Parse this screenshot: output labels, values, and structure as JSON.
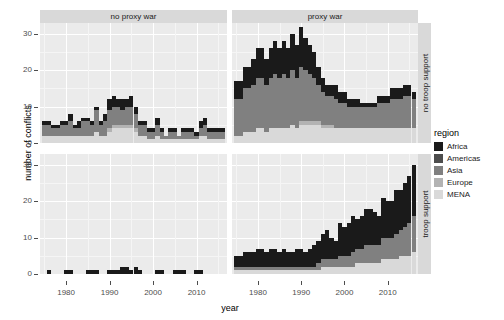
{
  "chart_data": {
    "type": "bar",
    "title": "",
    "xlabel": "year",
    "ylabel": "number of conflicts",
    "stacked": true,
    "grid": true,
    "legend_position": "right",
    "legend_title": "region",
    "xlim": [
      1974,
      2017
    ],
    "ylim": [
      0,
      33
    ],
    "xticks": [
      1980,
      1990,
      2000,
      2010
    ],
    "yticks": [
      0,
      10,
      20,
      30
    ],
    "col_facets": [
      "no proxy war",
      "proxy war"
    ],
    "row_facets": [
      "no troop support",
      "troop support"
    ],
    "series": [
      {
        "name": "Africa",
        "color": "#1a1a1a"
      },
      {
        "name": "Americas",
        "color": "#4d4d4d"
      },
      {
        "name": "Asia",
        "color": "#808080"
      },
      {
        "name": "Europe",
        "color": "#b3b3b3"
      },
      {
        "name": "MENA",
        "color": "#d9d9d9"
      }
    ],
    "years": [
      1975,
      1976,
      1977,
      1978,
      1979,
      1980,
      1981,
      1982,
      1983,
      1984,
      1985,
      1986,
      1987,
      1988,
      1989,
      1990,
      1991,
      1992,
      1993,
      1994,
      1995,
      1996,
      1997,
      1998,
      1999,
      2000,
      2001,
      2002,
      2003,
      2004,
      2005,
      2006,
      2007,
      2008,
      2009,
      2010,
      2011,
      2012,
      2013,
      2014,
      2015,
      2016
    ],
    "panels": [
      {
        "col": "no proxy war",
        "row": "no troop support",
        "values": {
          "Africa": [
            1,
            1,
            1,
            1,
            1,
            1,
            2,
            1,
            2,
            1,
            1,
            1,
            1,
            1,
            2,
            3,
            3,
            2,
            3,
            2,
            3,
            2,
            1,
            1,
            1,
            1,
            2,
            1,
            0,
            1,
            1,
            0,
            1,
            1,
            1,
            1,
            2,
            2,
            1,
            1,
            1,
            1
          ],
          "Americas": [
            0,
            0,
            0,
            0,
            0,
            0,
            0,
            0,
            0,
            0,
            0,
            0,
            0,
            0,
            0,
            0,
            0,
            0,
            0,
            0,
            0,
            0,
            0,
            0,
            0,
            0,
            0,
            0,
            0,
            0,
            0,
            0,
            0,
            0,
            0,
            0,
            0,
            0,
            0,
            0,
            0,
            0
          ],
          "Asia": [
            3,
            3,
            2,
            2,
            3,
            3,
            4,
            2,
            2,
            4,
            4,
            3,
            6,
            3,
            4,
            5,
            5,
            5,
            4,
            5,
            5,
            4,
            3,
            3,
            2,
            2,
            3,
            2,
            1,
            2,
            2,
            1,
            2,
            2,
            2,
            1,
            2,
            3,
            2,
            2,
            2,
            2
          ],
          "Europe": [
            0,
            0,
            0,
            0,
            0,
            0,
            0,
            0,
            0,
            0,
            0,
            0,
            0,
            0,
            0,
            1,
            1,
            1,
            1,
            1,
            1,
            1,
            0,
            0,
            0,
            0,
            0,
            0,
            0,
            0,
            0,
            0,
            0,
            0,
            0,
            0,
            0,
            0,
            0,
            0,
            0,
            0
          ],
          "MENA": [
            2,
            2,
            2,
            2,
            2,
            2,
            2,
            2,
            2,
            2,
            2,
            2,
            3,
            2,
            2,
            3,
            4,
            4,
            4,
            4,
            4,
            3,
            2,
            2,
            1,
            1,
            2,
            1,
            1,
            1,
            1,
            1,
            1,
            1,
            1,
            1,
            2,
            2,
            1,
            1,
            1,
            1
          ]
        }
      },
      {
        "col": "proxy war",
        "row": "no troop support",
        "values": {
          "Africa": [
            5,
            5,
            6,
            6,
            7,
            8,
            8,
            7,
            8,
            9,
            8,
            9,
            8,
            10,
            9,
            11,
            9,
            8,
            7,
            5,
            4,
            3,
            3,
            4,
            3,
            3,
            2,
            2,
            2,
            1,
            1,
            1,
            1,
            2,
            2,
            2,
            3,
            3,
            3,
            3,
            3,
            2
          ],
          "Americas": [
            0,
            0,
            0,
            0,
            0,
            0,
            0,
            0,
            0,
            0,
            0,
            0,
            0,
            0,
            0,
            0,
            0,
            0,
            0,
            0,
            0,
            0,
            0,
            0,
            0,
            0,
            0,
            0,
            0,
            0,
            0,
            0,
            0,
            0,
            0,
            0,
            0,
            0,
            0,
            0,
            0,
            0
          ],
          "Asia": [
            10,
            10,
            12,
            12,
            13,
            14,
            14,
            13,
            14,
            15,
            14,
            15,
            14,
            15,
            14,
            15,
            14,
            13,
            12,
            10,
            9,
            8,
            8,
            8,
            7,
            7,
            6,
            6,
            6,
            6,
            6,
            6,
            6,
            7,
            7,
            7,
            8,
            8,
            8,
            9,
            9,
            8
          ],
          "Europe": [
            0,
            0,
            0,
            0,
            0,
            0,
            0,
            0,
            0,
            0,
            0,
            0,
            0,
            0,
            0,
            1,
            1,
            1,
            1,
            1,
            1,
            1,
            1,
            0,
            0,
            0,
            0,
            0,
            0,
            0,
            0,
            0,
            0,
            0,
            0,
            0,
            0,
            0,
            0,
            0,
            0,
            0
          ],
          "MENA": [
            2,
            2,
            3,
            3,
            3,
            4,
            4,
            3,
            4,
            4,
            4,
            4,
            4,
            5,
            4,
            5,
            5,
            5,
            5,
            5,
            4,
            4,
            4,
            4,
            4,
            4,
            4,
            4,
            4,
            4,
            4,
            4,
            4,
            4,
            4,
            4,
            4,
            4,
            4,
            4,
            4,
            4
          ]
        }
      },
      {
        "col": "no proxy war",
        "row": "troop support",
        "values": {
          "Africa": [
            0,
            1,
            0,
            0,
            0,
            1,
            1,
            0,
            0,
            0,
            1,
            1,
            1,
            0,
            0,
            1,
            1,
            1,
            2,
            2,
            1,
            2,
            1,
            0,
            0,
            0,
            1,
            1,
            0,
            0,
            1,
            1,
            1,
            0,
            0,
            1,
            1,
            0,
            0,
            0,
            0,
            0
          ],
          "Americas": [
            0,
            0,
            0,
            0,
            0,
            0,
            0,
            0,
            0,
            0,
            0,
            0,
            0,
            0,
            0,
            0,
            0,
            0,
            0,
            0,
            0,
            0,
            0,
            0,
            0,
            0,
            0,
            0,
            0,
            0,
            0,
            0,
            0,
            0,
            0,
            0,
            0,
            0,
            0,
            0,
            0,
            0
          ],
          "Asia": [
            0,
            0,
            0,
            0,
            0,
            0,
            0,
            0,
            0,
            0,
            0,
            0,
            0,
            0,
            0,
            0,
            0,
            0,
            0,
            0,
            0,
            0,
            0,
            0,
            0,
            0,
            0,
            0,
            0,
            0,
            0,
            0,
            0,
            0,
            0,
            0,
            0,
            0,
            0,
            0,
            0,
            0
          ],
          "Europe": [
            0,
            0,
            0,
            0,
            0,
            0,
            0,
            0,
            0,
            0,
            0,
            0,
            0,
            0,
            0,
            0,
            0,
            0,
            0,
            0,
            0,
            0,
            0,
            0,
            0,
            0,
            0,
            0,
            0,
            0,
            0,
            0,
            0,
            0,
            0,
            0,
            0,
            0,
            0,
            0,
            0,
            0
          ],
          "MENA": [
            0,
            0,
            0,
            0,
            0,
            0,
            0,
            0,
            0,
            0,
            0,
            0,
            0,
            0,
            0,
            0,
            0,
            0,
            0,
            0,
            0,
            0,
            0,
            0,
            0,
            0,
            0,
            0,
            0,
            0,
            0,
            0,
            0,
            0,
            0,
            0,
            0,
            0,
            0,
            0,
            0,
            0
          ]
        }
      },
      {
        "col": "proxy war",
        "row": "troop support",
        "values": {
          "Africa": [
            3,
            3,
            4,
            4,
            4,
            5,
            5,
            4,
            5,
            5,
            4,
            5,
            4,
            4,
            5,
            5,
            4,
            5,
            6,
            6,
            7,
            8,
            6,
            5,
            9,
            8,
            9,
            10,
            8,
            9,
            10,
            10,
            9,
            8,
            11,
            10,
            10,
            12,
            11,
            12,
            13,
            14
          ],
          "Americas": [
            0,
            0,
            0,
            0,
            0,
            0,
            0,
            0,
            0,
            0,
            0,
            0,
            0,
            0,
            0,
            0,
            0,
            0,
            0,
            0,
            0,
            0,
            0,
            0,
            0,
            0,
            0,
            0,
            0,
            0,
            0,
            0,
            0,
            0,
            0,
            0,
            0,
            0,
            0,
            0,
            0,
            0
          ],
          "Asia": [
            1,
            1,
            1,
            1,
            1,
            1,
            1,
            1,
            1,
            1,
            1,
            1,
            1,
            1,
            1,
            1,
            1,
            1,
            1,
            2,
            2,
            2,
            2,
            2,
            3,
            3,
            3,
            4,
            4,
            4,
            5,
            5,
            5,
            5,
            6,
            6,
            6,
            7,
            7,
            8,
            9,
            10
          ],
          "Europe": [
            0,
            0,
            0,
            0,
            0,
            0,
            0,
            0,
            0,
            0,
            0,
            0,
            0,
            0,
            0,
            0,
            0,
            0,
            0,
            0,
            0,
            0,
            0,
            0,
            0,
            0,
            0,
            0,
            0,
            0,
            0,
            0,
            0,
            0,
            0,
            0,
            0,
            0,
            0,
            0,
            0,
            0
          ],
          "MENA": [
            1,
            1,
            1,
            1,
            1,
            1,
            1,
            1,
            1,
            1,
            1,
            1,
            1,
            1,
            1,
            1,
            1,
            1,
            1,
            1,
            2,
            2,
            2,
            2,
            2,
            2,
            2,
            2,
            3,
            3,
            3,
            3,
            3,
            3,
            4,
            4,
            4,
            4,
            5,
            5,
            5,
            6
          ]
        }
      }
    ]
  },
  "axes": {
    "ylabel": "number of conflicts",
    "xlabel": "year",
    "yticklabels": [
      "30",
      "20",
      "10",
      "0"
    ],
    "xticklabels": [
      "1980",
      "1990",
      "2000",
      "2010"
    ]
  },
  "strips": {
    "top_left": "no proxy war",
    "top_right": "proxy war",
    "right_top": "no troop support",
    "right_bottom": "troop support"
  },
  "legend": {
    "title": "region",
    "items": [
      {
        "label": "Africa",
        "color": "#1a1a1a"
      },
      {
        "label": "Americas",
        "color": "#4d4d4d"
      },
      {
        "label": "Asia",
        "color": "#808080"
      },
      {
        "label": "Europe",
        "color": "#b3b3b3"
      },
      {
        "label": "MENA",
        "color": "#d9d9d9"
      }
    ]
  }
}
